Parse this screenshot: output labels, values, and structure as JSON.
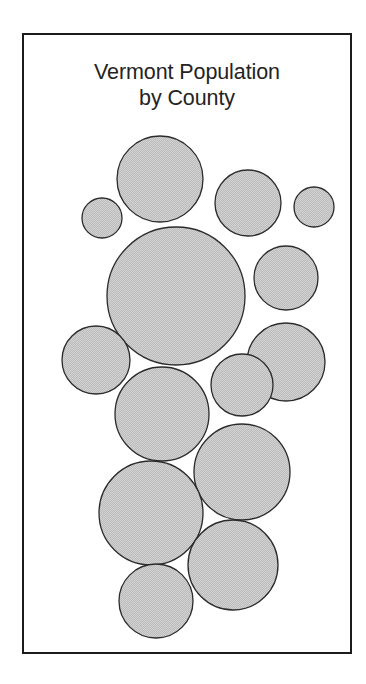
{
  "figure": {
    "title": "Vermont Population\nby County",
    "title_line_1": "Vermont Population",
    "title_line_2": "by County",
    "frame_color": "#1c1c1c",
    "background_color": "#ffffff",
    "bubble_fill_color": "#c9c9c9",
    "bubble_stroke_color": "#2b2b2b"
  },
  "chart_data": {
    "type": "bubble",
    "title": "Vermont Population by County",
    "subtitle": "",
    "xlabel": "",
    "ylabel": "",
    "legend": [],
    "grid": false,
    "axes_visible": false,
    "labels_visible": false,
    "note": "Non-cartesian circle-packing bubble chart; each circle is a Vermont county sized by population. No numeric labels, axis ticks, or legend are printed in the figure.",
    "circle_count": 13,
    "units": "pixels (figure-local coordinates, origin at inner top-left of frame)",
    "circles": [
      {
        "id": "c1",
        "cx": 136,
        "cy": 144,
        "r": 43,
        "size_rank": 2
      },
      {
        "id": "c2",
        "cx": 224,
        "cy": 168,
        "r": 33,
        "size_rank": 6
      },
      {
        "id": "c3",
        "cx": 290,
        "cy": 172,
        "r": 20,
        "size_rank": 12
      },
      {
        "id": "c4",
        "cx": 78,
        "cy": 183,
        "r": 20,
        "size_rank": 13
      },
      {
        "id": "c5",
        "cx": 152,
        "cy": 261,
        "r": 69,
        "size_rank": 1
      },
      {
        "id": "c6",
        "cx": 262,
        "cy": 243,
        "r": 32,
        "size_rank": 7
      },
      {
        "id": "c7",
        "cx": 262,
        "cy": 327,
        "r": 39,
        "size_rank": 5
      },
      {
        "id": "c8",
        "cx": 72,
        "cy": 325,
        "r": 34,
        "size_rank": 8
      },
      {
        "id": "c9",
        "cx": 138,
        "cy": 379,
        "r": 47,
        "size_rank": 4
      },
      {
        "id": "c10",
        "cx": 218,
        "cy": 350,
        "r": 31,
        "size_rank": 9
      },
      {
        "id": "c11",
        "cx": 218,
        "cy": 437,
        "r": 48,
        "size_rank": 3
      },
      {
        "id": "c12",
        "cx": 127,
        "cy": 478,
        "r": 52,
        "size_rank": 3
      },
      {
        "id": "c13",
        "cx": 209,
        "cy": 530,
        "r": 45,
        "size_rank": 4
      },
      {
        "id": "c14",
        "cx": 132,
        "cy": 566,
        "r": 37,
        "size_rank": 6
      }
    ]
  }
}
